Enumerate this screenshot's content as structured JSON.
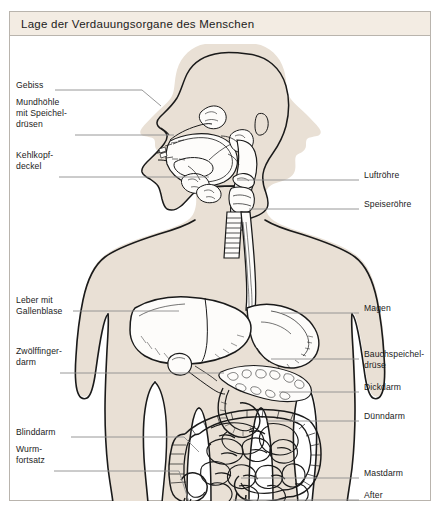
{
  "title": "Lage der Verdauungsorgane des Menschen",
  "colors": {
    "page_background": "#ffffff",
    "frame_border": "#b9b4ad",
    "title_bar_background": "#f3ece3",
    "body_fill": "#e9e0d5",
    "organ_fill": "#fdfcfa",
    "outline": "#1a1a1a",
    "leader_line": "#8c8c8c",
    "text": "#1b1b1b"
  },
  "labels": {
    "left": [
      {
        "id": "gebiss",
        "text": "Gebiss",
        "x": 7,
        "y": 49,
        "leader_y": 54,
        "leader_x1": 46,
        "leader_x2": 133,
        "bend_x": 152,
        "bend_y": 70
      },
      {
        "id": "mundhoehle",
        "text": "Mundhöhle\nmit Speichel-\ndrüsen",
        "x": 7,
        "y": 66,
        "leader_y": 99,
        "leader_x1": 66,
        "leader_x2": 165,
        "bend_x": 165,
        "bend_y": 99
      },
      {
        "id": "kehlkopfdeckel",
        "text": "Kehlkopf-\ndeckel",
        "x": 7,
        "y": 119,
        "leader_y": 141,
        "leader_x1": 50,
        "leader_x2": 200,
        "bend_x": 200,
        "bend_y": 141
      },
      {
        "id": "leber",
        "text": "Leber mit\nGallenblase",
        "x": 7,
        "y": 264,
        "leader_y": 275,
        "leader_x1": 64,
        "leader_x2": 170,
        "bend_x": 170,
        "bend_y": 275
      },
      {
        "id": "zwoelffingerdarm",
        "text": "Zwölffinger-\ndarm",
        "x": 7,
        "y": 315,
        "leader_y": 337,
        "leader_x1": 51,
        "leader_x2": 215,
        "bend_x": 215,
        "bend_y": 337
      },
      {
        "id": "blinddarm",
        "text": "Blinddarm",
        "x": 7,
        "y": 396,
        "leader_y": 401,
        "leader_x1": 62,
        "leader_x2": 175,
        "bend_x": 175,
        "bend_y": 401
      },
      {
        "id": "wurmfortsatz",
        "text": "Wurm-\nfortsatz",
        "x": 7,
        "y": 413,
        "leader_y": 435,
        "leader_x1": 45,
        "leader_x2": 178,
        "bend_x": 196,
        "bend_y": 423
      }
    ],
    "right": [
      {
        "id": "luftroehre",
        "text": "Luftröhre",
        "x": 355,
        "y": 139,
        "leader_y": 144,
        "leader_x1": 228,
        "leader_x2": 350
      },
      {
        "id": "speiseroehre",
        "text": "Speiseröhre",
        "x": 355,
        "y": 168,
        "leader_y": 173,
        "leader_x1": 235,
        "leader_x2": 350
      },
      {
        "id": "magen",
        "text": "Magen",
        "x": 355,
        "y": 272,
        "leader_y": 277,
        "leader_x1": 272,
        "leader_x2": 350
      },
      {
        "id": "bauchspeicheldruese",
        "text": "Bauchspeichel-\ndrüse",
        "x": 355,
        "y": 318,
        "leader_y": 323,
        "leader_x1": 262,
        "leader_x2": 350
      },
      {
        "id": "dickdarm",
        "text": "Dickdarm",
        "x": 355,
        "y": 351,
        "leader_y": 356,
        "leader_x1": 270,
        "leader_x2": 350
      },
      {
        "id": "duenndarm",
        "text": "Dünndarm",
        "x": 355,
        "y": 380,
        "leader_y": 385,
        "leader_x1": 258,
        "leader_x2": 350
      },
      {
        "id": "mastdarm",
        "text": "Mastdarm",
        "x": 355,
        "y": 437,
        "leader_y": 442,
        "leader_x1": 232,
        "leader_x2": 350
      },
      {
        "id": "after",
        "text": "After",
        "x": 355,
        "y": 459,
        "leader_y": 464,
        "leader_x1": 224,
        "leader_x2": 350
      }
    ]
  },
  "organs": [
    "Gebiss",
    "Mundhöhle mit Speicheldrüsen",
    "Kehlkopfdeckel",
    "Luftröhre",
    "Speiseröhre",
    "Leber mit Gallenblase",
    "Magen",
    "Bauchspeicheldrüse",
    "Zwölffingerdarm",
    "Dickdarm",
    "Dünndarm",
    "Blinddarm",
    "Wurmfortsatz",
    "Mastdarm",
    "After"
  ]
}
